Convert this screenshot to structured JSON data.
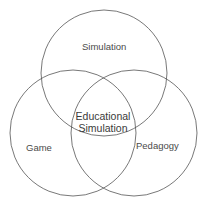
{
  "diagram": {
    "type": "venn",
    "stroke_color": "#555555",
    "background": "#ffffff",
    "circles": [
      {
        "id": "simulation",
        "label": "Simulation",
        "cx": 104,
        "cy": 73,
        "r": 63
      },
      {
        "id": "game",
        "label": "Game",
        "cx": 73,
        "cy": 133,
        "r": 63
      },
      {
        "id": "pedagogy",
        "label": "Pedagogy",
        "cx": 134,
        "cy": 133,
        "r": 63
      }
    ],
    "intersection": {
      "line1": "Educational",
      "line2": "Simulation"
    }
  }
}
